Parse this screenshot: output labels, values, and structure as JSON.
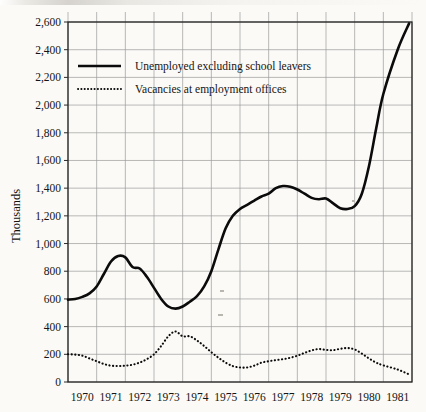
{
  "chart_data": {
    "type": "line",
    "title": "",
    "subtitle": "",
    "xlabel": "",
    "ylabel": "Thousands",
    "xlim": [
      1970,
      1982
    ],
    "ylim": [
      0,
      2600
    ],
    "ytick_step": 200,
    "grid": true,
    "legend_position": "upper-left-inside",
    "x_tick_labels": [
      "1970",
      "1971",
      "1972",
      "1973",
      "1974",
      "1975",
      "1976",
      "1977",
      "1978",
      "1979",
      "1980",
      "1981"
    ],
    "y_tick_labels": [
      "0",
      "200",
      "400",
      "600",
      "800",
      "1,000",
      "1,200",
      "1,400",
      "1,600",
      "1,800",
      "2,000",
      "2,200",
      "2,400",
      "2,600"
    ],
    "y_tick_values": [
      0,
      200,
      400,
      600,
      800,
      1000,
      1200,
      1400,
      1600,
      1800,
      2000,
      2200,
      2400,
      2600
    ],
    "series": [
      {
        "name": "Unemployed excluding school leavers",
        "style": "solid",
        "color": "#0b0b0b",
        "x": [
          1970.0,
          1970.25,
          1970.5,
          1970.75,
          1971.0,
          1971.25,
          1971.5,
          1971.75,
          1972.0,
          1972.25,
          1972.5,
          1972.75,
          1973.0,
          1973.25,
          1973.5,
          1973.75,
          1974.0,
          1974.25,
          1974.5,
          1974.75,
          1975.0,
          1975.25,
          1975.5,
          1975.75,
          1976.0,
          1976.25,
          1976.5,
          1976.75,
          1977.0,
          1977.25,
          1977.5,
          1977.75,
          1978.0,
          1978.25,
          1978.5,
          1978.75,
          1979.0,
          1979.25,
          1979.5,
          1979.75,
          1980.0,
          1980.25,
          1980.5,
          1980.75,
          1981.0,
          1981.5,
          1981.9
        ],
        "y": [
          595,
          600,
          615,
          640,
          690,
          780,
          870,
          910,
          900,
          830,
          820,
          760,
          680,
          600,
          545,
          530,
          545,
          580,
          620,
          690,
          800,
          960,
          1110,
          1200,
          1250,
          1280,
          1310,
          1340,
          1360,
          1400,
          1415,
          1410,
          1390,
          1360,
          1330,
          1320,
          1325,
          1290,
          1255,
          1250,
          1270,
          1360,
          1560,
          1830,
          2080,
          2400,
          2590
        ]
      },
      {
        "name": "Vacancies at employment offices",
        "style": "dotted",
        "color": "#0b0b0b",
        "x": [
          1970.0,
          1970.25,
          1970.5,
          1970.75,
          1971.0,
          1971.25,
          1971.5,
          1971.75,
          1972.0,
          1972.25,
          1972.5,
          1972.75,
          1973.0,
          1973.25,
          1973.5,
          1973.75,
          1974.0,
          1974.25,
          1974.5,
          1974.75,
          1975.0,
          1975.25,
          1975.5,
          1975.75,
          1976.0,
          1976.25,
          1976.5,
          1976.75,
          1977.0,
          1977.25,
          1977.5,
          1977.75,
          1978.0,
          1978.25,
          1978.5,
          1978.75,
          1979.0,
          1979.25,
          1979.5,
          1979.75,
          1980.0,
          1980.25,
          1980.5,
          1980.75,
          1981.0,
          1981.5,
          1981.9
        ],
        "y": [
          200,
          198,
          190,
          170,
          150,
          130,
          118,
          115,
          118,
          125,
          140,
          165,
          200,
          260,
          330,
          365,
          330,
          330,
          300,
          260,
          215,
          175,
          140,
          115,
          105,
          105,
          118,
          140,
          150,
          158,
          165,
          175,
          190,
          210,
          228,
          238,
          232,
          230,
          240,
          245,
          235,
          205,
          170,
          140,
          120,
          90,
          55
        ]
      }
    ],
    "annotations": []
  },
  "legend": {
    "entries": [
      {
        "label": "Unemployed excluding school leavers",
        "style": "solid"
      },
      {
        "label": "Vacancies at employment offices",
        "style": "dotted"
      }
    ]
  }
}
